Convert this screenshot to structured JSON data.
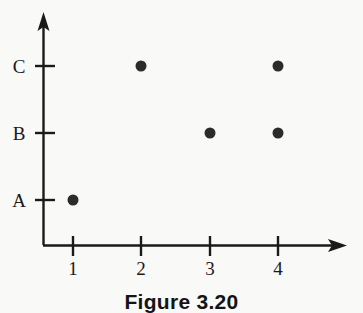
{
  "figure": {
    "caption": "Figure 3.20",
    "background_color": "#f9f9f7",
    "ink_color": "#1a1a1a",
    "point_color": "#2b2b2b"
  },
  "axes": {
    "y_axis_name": "vertical-axis",
    "x_axis_name": "horizontal-axis",
    "y_ticks": [
      "A",
      "B",
      "C"
    ],
    "x_ticks": [
      "1",
      "2",
      "3",
      "4"
    ]
  },
  "chart_data": {
    "type": "scatter",
    "title": "Figure 3.20",
    "xlabel": "",
    "ylabel": "",
    "grid": false,
    "legend": null,
    "x_tick_labels": [
      "1",
      "2",
      "3",
      "4"
    ],
    "y_tick_labels": [
      "A",
      "B",
      "C"
    ],
    "xlim": [
      0,
      5
    ],
    "ylim": [
      "",
      "C+"
    ],
    "points": [
      {
        "x": 1,
        "y": "A"
      },
      {
        "x": 2,
        "y": "C"
      },
      {
        "x": 3,
        "y": "B"
      },
      {
        "x": 4,
        "y": "B"
      },
      {
        "x": 4,
        "y": "C"
      }
    ],
    "marker": "filled-circle",
    "marker_color": "#2b2b2b",
    "marker_size": 11
  },
  "pixel_geometry": {
    "origin_x": 43,
    "origin_y": 245,
    "x_tick_px": [
      73,
      141,
      210,
      278
    ],
    "y_tick_px": [
      200,
      133,
      66
    ],
    "x_axis_end": 345,
    "y_axis_end": 14
  }
}
